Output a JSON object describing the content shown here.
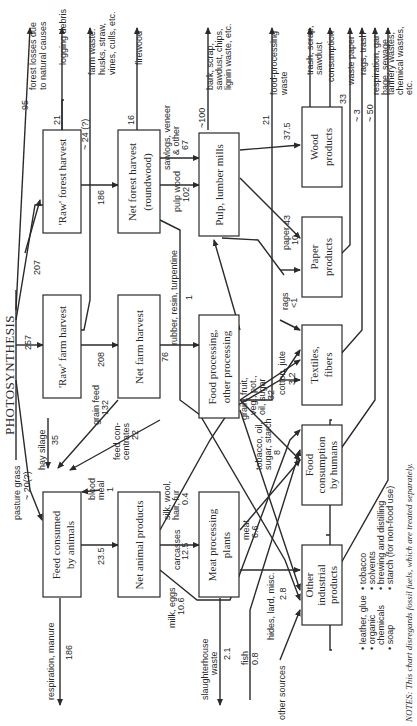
{
  "title": "PHOTOSYNTHESIS",
  "boxes": {
    "raw_forest": "'Raw' forest harvest",
    "raw_farm": "'Raw' farm harvest",
    "feed_animals_1": "Feed consumed",
    "feed_animals_2": "by animals",
    "net_forest_1": "Net forest harvest",
    "net_forest_2": "(roundwood)",
    "net_farm": "Net farm harvest",
    "net_animal": "Net animal products",
    "pulp_mills": "Pulp, lumber mills",
    "food_proc_1": "Food processing,",
    "food_proc_2": "other processing",
    "meat_plants_1": "Meat processing",
    "meat_plants_2": "plants",
    "paper_1": "Paper",
    "paper_2": "products",
    "wood_1": "Wood",
    "wood_2": "products",
    "textiles_1": "Textiles,",
    "textiles_2": "fibers",
    "food_humans_1": "Food",
    "food_humans_2": "consumption",
    "food_humans_3": "by humans",
    "other_ind_1": "Other",
    "other_ind_2": "industrial",
    "other_ind_3": "products"
  },
  "flows": {
    "forest_losses_val": "95",
    "forest_losses_1": "forest losses due",
    "forest_losses_2": "to natural causes",
    "logging_debris_val": "21",
    "logging_debris": "logging debris",
    "farm_waste_val": "~ 24 (?)",
    "farm_waste_1": "farm waste:",
    "farm_waste_2": "husks, straw,",
    "farm_waste_3": "vines, culls, etc.",
    "firewood_val": "16",
    "firewood": "firewood",
    "raw_forest_in": "207",
    "raw_farm_in": "257",
    "forest_to_net": "186",
    "farm_to_net": "208",
    "pasture_1": "pasture grass",
    "pasture_val": "~ 20(?)",
    "hay_silage": "hay silage",
    "hay_silage_val": "35",
    "grain_feed": "grain feed",
    "grain_feed_val": "132",
    "feed_conc_1": "feed con-",
    "feed_conc_2": "centrates",
    "feed_conc_val": "22",
    "blood_meal_1": "blood",
    "blood_meal_2": "meal",
    "blood_meal_val": "1",
    "feed_to_animal": "23.5",
    "respiration_manure": "respiration, manure",
    "respiration_manure_val": "186",
    "sawlogs_1": "sawlogs, veneer",
    "sawlogs_2": "& other",
    "sawlogs_val": "67",
    "pulpwood_1": "pulp wood",
    "pulpwood_val": "102",
    "bark_val": "~100",
    "bark_1": "bark, scrap,",
    "bark_2": "sawdust, chips,",
    "bark_3": "lignin waste, etc.",
    "rubber": "rubber, resin, turpentine",
    "rubber_val": "1",
    "netfarm_to_food": "76",
    "food_waste_val": "21",
    "food_waste_1": "food-processing",
    "food_waste_2": "waste",
    "silk_1": "silk, wool,",
    "silk_2": "hair, fur",
    "silk_val": "0.4",
    "carcasses": "carcasses",
    "carcasses_val": "12.5",
    "milk_eggs": "milk, eggs",
    "milk_eggs_val": "10.6",
    "slaughter_1": "slaughterhouse",
    "slaughter_2": "waste",
    "slaughter_val": "2.1",
    "fish": "fish",
    "fish_val": "0.8",
    "meat": "meat",
    "meat_val": "6.6",
    "hides": "hides, lard, misc.",
    "hides_val": "2.8",
    "other_sources": "other sources",
    "tobacco_1": "tobacco, oil,",
    "tobacco_2": "sugar, starch",
    "tobacco_val": "8",
    "grain_1": "grain, fruit,",
    "grain_2": "veg., pot.,",
    "grain_3": "oil, sugar",
    "grain_val": "32",
    "cotton": "cotton, jute",
    "cotton_val": "3.2",
    "rags_1": "rags",
    "rags_val": "<1",
    "paper_1": "paper",
    "paper_val": "10",
    "to_paper": "43",
    "to_wood": "37.5",
    "trash_1": "trash, scrap,",
    "trash_2": "sawdust",
    "consumption": "consumption",
    "waste_paper_val": "33",
    "waste_paper": "waste paper",
    "rags_trash_val": "~ 3",
    "rags_trash": "rags, trash",
    "resp_garbage_val": "~ 50",
    "resp_garbage_1": "respiration, gar-",
    "resp_garbage_2": "bage, sewage",
    "tannery_1": "tannery wastes,",
    "tannery_2": "chemical wastes,",
    "tannery_3": "etc."
  },
  "products_list": {
    "col1": [
      "• leather, glue",
      "• organic",
      "   chemicals",
      "• soap"
    ],
    "col2": [
      "• tobacco",
      "• solvents",
      "• brewing and distilling",
      "• starch (for non-food use)"
    ]
  },
  "notes": "NOTES: This chart disregards fossil fuels, which are treated separately."
}
